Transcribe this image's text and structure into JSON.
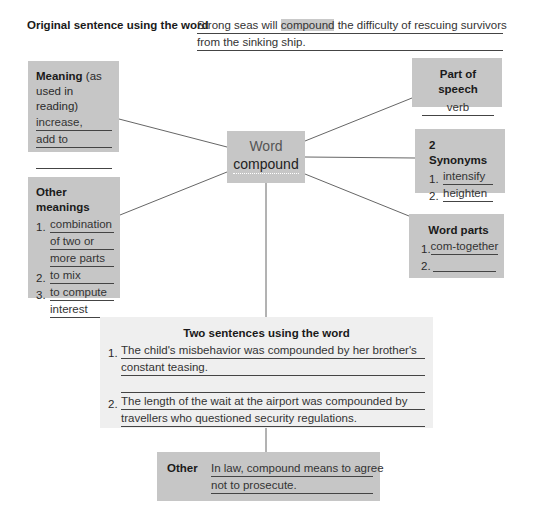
{
  "original": {
    "label": "Original sentence using the word",
    "line1_pre": "Strong seas will ",
    "line1_highlight": "compound",
    "line1_post": " the difficulty of rescuing survivors",
    "line2": "from the sinking ship."
  },
  "meaning": {
    "title_bold": "Meaning",
    "title_rest": " (as",
    "title_line2": "used in reading)",
    "lines": [
      "increase,",
      "add to",
      ""
    ]
  },
  "other_meanings": {
    "title": "Other meanings",
    "items": [
      {
        "num": "1.",
        "lines": [
          "combination",
          "of two or",
          "more parts"
        ]
      },
      {
        "num": "2.",
        "lines": [
          "to mix"
        ]
      },
      {
        "num": "3.",
        "lines": [
          "to compute",
          "interest"
        ]
      }
    ]
  },
  "center": {
    "label": "Word",
    "word": "compound"
  },
  "part_of_speech": {
    "title": "Part of speech",
    "value": "verb"
  },
  "synonyms": {
    "title": "2 Synonyms",
    "items": [
      {
        "num": "1.",
        "value": "intensify"
      },
      {
        "num": "2.",
        "value": "heighten"
      }
    ]
  },
  "word_parts": {
    "title": "Word parts",
    "items": [
      {
        "num": "1.",
        "value": "com-together"
      },
      {
        "num": "2.",
        "value": ""
      }
    ]
  },
  "two_sentences": {
    "title": "Two sentences using the word",
    "items": [
      {
        "num": "1.",
        "lines": [
          "The child's misbehavior was compounded by her brother's",
          "constant teasing.",
          ""
        ]
      },
      {
        "num": "2.",
        "lines": [
          "The length of the wait at the airport was compounded by",
          "travellers who questioned security regulations."
        ]
      }
    ]
  },
  "other": {
    "label": "Other",
    "lines": [
      "In law, compound means to agree",
      "not to prosecute."
    ]
  },
  "colors": {
    "box_fill": "#c6c6c6",
    "light_box_fill": "#efefef",
    "line": "#555555"
  }
}
